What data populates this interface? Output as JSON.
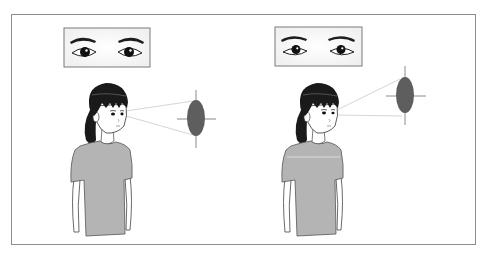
{
  "figure": {
    "colors": {
      "frame_border": "#8c8c8c",
      "target_fill": "#5e5e5e",
      "crosshair": "#8a8a8a",
      "sight_lines": "#d6d6d6",
      "shirt": "#b4b4b4",
      "hair": "#1a1a1a",
      "skin": "#ffffff"
    },
    "panels": [
      {
        "id": "left",
        "label": "Looking straight ahead",
        "eyes_inset": {
          "x": 64,
          "y": 28,
          "w": 86,
          "h": 39,
          "gaze": "forward"
        },
        "target": {
          "cx": 196,
          "cy": 118,
          "rx": 9,
          "ry": 18
        },
        "head": {
          "cx": 107,
          "cy": 108
        }
      },
      {
        "id": "right",
        "label": "Looking upward",
        "eyes_inset": {
          "x": 275,
          "y": 27,
          "w": 87,
          "h": 39,
          "gaze": "up"
        },
        "target": {
          "cx": 405,
          "cy": 95,
          "rx": 9,
          "ry": 18
        },
        "head": {
          "cx": 318,
          "cy": 108
        }
      }
    ]
  }
}
